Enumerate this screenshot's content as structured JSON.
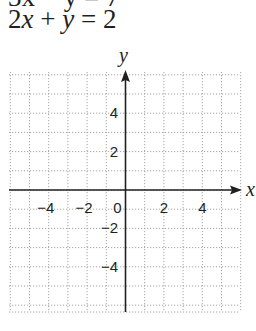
{
  "problem": {
    "previous_equation_partial": "3x − y = 7",
    "equation": {
      "coef_x": "2",
      "var_x": "x",
      "op": "+",
      "var_y": "y",
      "eq": "=",
      "rhs": "2"
    }
  },
  "chart_data": {
    "type": "coordinate-grid",
    "title": "2x + y = 2",
    "xlabel": "x",
    "ylabel": "y",
    "xlim": [
      -6,
      6
    ],
    "ylim": [
      -6.2,
      6
    ],
    "grid": true,
    "grid_style": "dotted",
    "grid_step": 1,
    "x_tick_labels": [
      "−4",
      "−2",
      "0",
      "2",
      "4"
    ],
    "x_tick_values": [
      -4,
      -2,
      0,
      2,
      4
    ],
    "y_tick_labels": [
      "4",
      "2",
      "−2",
      "−4"
    ],
    "y_tick_values": [
      4,
      2,
      -2,
      -4
    ],
    "series": []
  }
}
